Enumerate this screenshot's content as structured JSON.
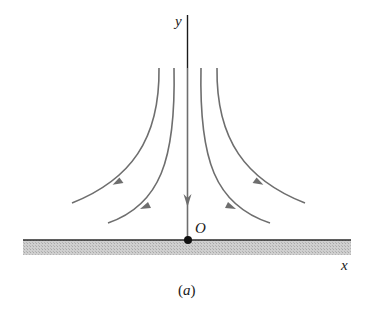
{
  "figure": {
    "caption_open": "(",
    "caption_letter": "a",
    "caption_close": ")",
    "labels": {
      "y_axis": "y",
      "x_axis": "x",
      "origin": "O"
    },
    "colors": {
      "axis": "#1a1a1a",
      "streamline": "#6e6e6e",
      "wall_fill": "#c4c4c4",
      "wall_line": "#2a2a2a"
    }
  },
  "streamlines": [
    {
      "name": "outer-left",
      "direction": "down-left"
    },
    {
      "name": "inner-left",
      "direction": "down-left"
    },
    {
      "name": "center",
      "direction": "down"
    },
    {
      "name": "inner-right",
      "direction": "down-right"
    },
    {
      "name": "outer-right",
      "direction": "down-right"
    }
  ]
}
